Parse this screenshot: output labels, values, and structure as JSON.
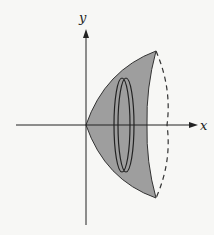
{
  "diagram": {
    "type": "solid-of-revolution",
    "axes": {
      "x_label": "x",
      "y_label": "y"
    },
    "colors": {
      "fill": "#9e9e9e",
      "stroke": "#333333",
      "background": "#f7f7f5"
    }
  }
}
